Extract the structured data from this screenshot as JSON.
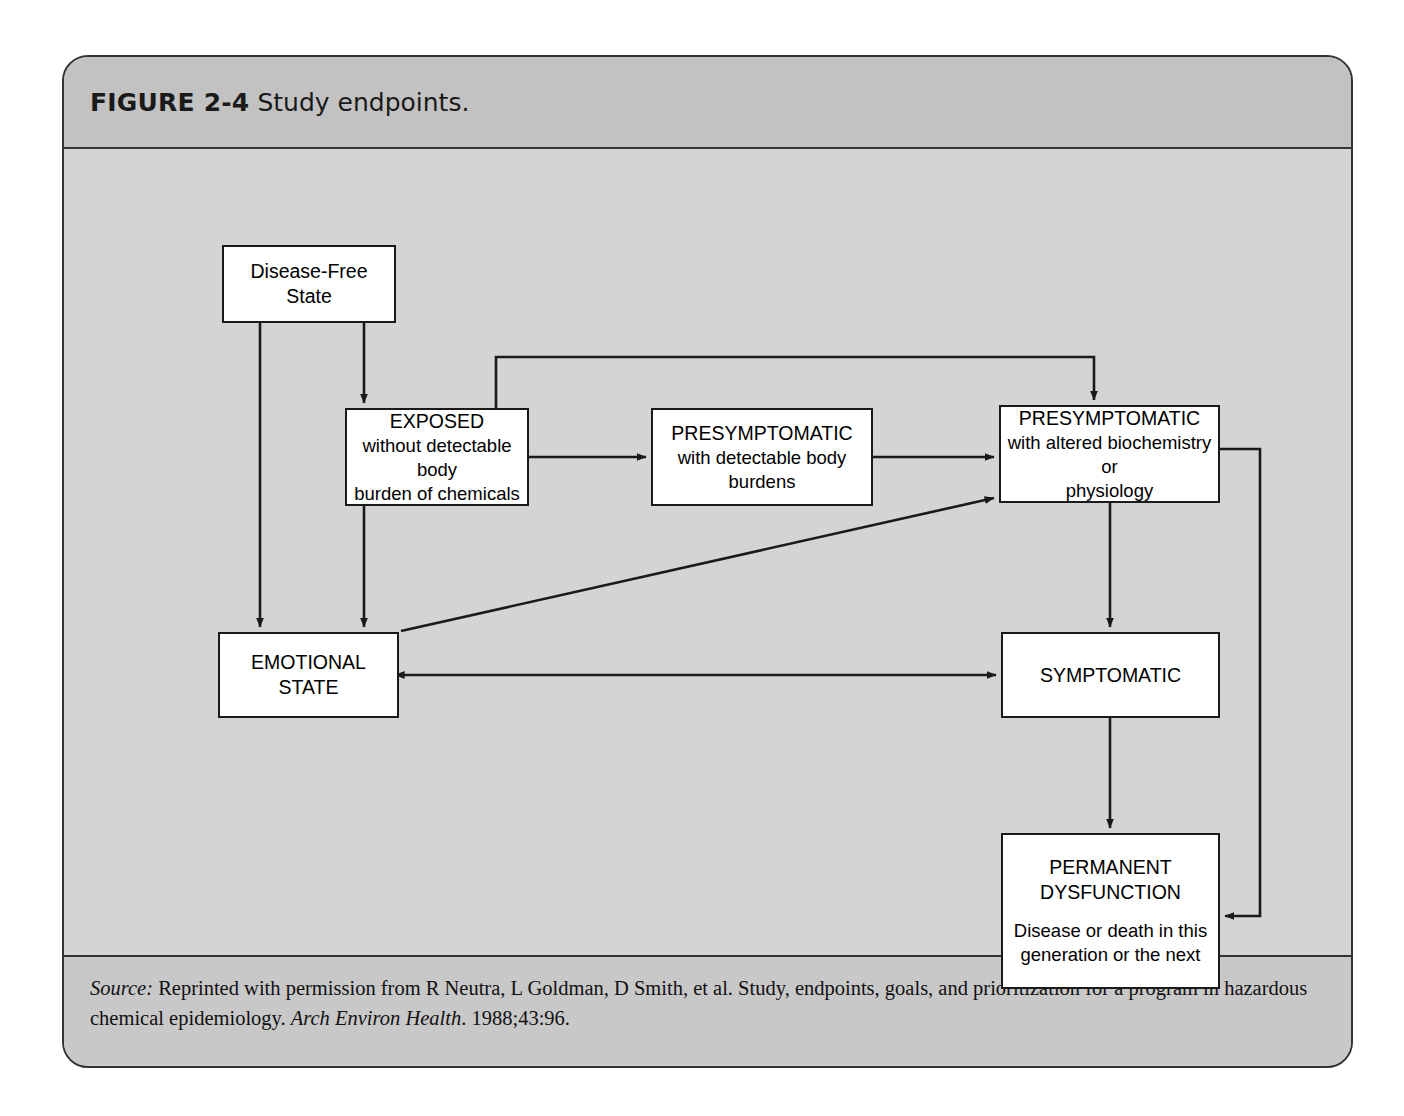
{
  "figure": {
    "number": "FIGURE 2-4",
    "caption": "Study endpoints."
  },
  "diagram": {
    "type": "flowchart",
    "nodes": [
      {
        "id": "disease-free-state",
        "title": "Disease-Free",
        "title2": "State",
        "subtitle": "",
        "subtitle2": "",
        "x": 158,
        "y": 96,
        "w": 174,
        "h": 78
      },
      {
        "id": "exposed",
        "title": "EXPOSED",
        "title2": "",
        "subtitle": "without detectable body",
        "subtitle2": "burden of chemicals",
        "x": 281,
        "y": 259,
        "w": 184,
        "h": 98
      },
      {
        "id": "presymptomatic-detectable",
        "title": "PRESYMPTOMATIC",
        "title2": "",
        "subtitle": "with detectable body burdens",
        "subtitle2": "",
        "x": 587,
        "y": 259,
        "w": 222,
        "h": 98
      },
      {
        "id": "presymptomatic-altered",
        "title": "PRESYMPTOMATIC",
        "title2": "",
        "subtitle": "with altered biochemistry or",
        "subtitle2": "physiology",
        "x": 935,
        "y": 256,
        "w": 221,
        "h": 98
      },
      {
        "id": "emotional-state",
        "title": "EMOTIONAL",
        "title2": "STATE",
        "subtitle": "",
        "subtitle2": "",
        "x": 154,
        "y": 483,
        "w": 181,
        "h": 86
      },
      {
        "id": "symptomatic",
        "title": "SYMPTOMATIC",
        "title2": "",
        "subtitle": "",
        "subtitle2": "",
        "x": 937,
        "y": 483,
        "w": 219,
        "h": 86
      },
      {
        "id": "permanent-dysfunction",
        "title": "PERMANENT",
        "title2": "DYSFUNCTION",
        "subtitle": "Disease or death in this",
        "subtitle2": "generation or the next",
        "x": 937,
        "y": 684,
        "w": 219,
        "h": 156
      }
    ],
    "edges": [
      {
        "from": "disease-free-state",
        "to": "emotional-state",
        "style": "orthogonal",
        "direction": "one-way"
      },
      {
        "from": "disease-free-state",
        "to": "exposed",
        "style": "orthogonal",
        "direction": "one-way"
      },
      {
        "from": "exposed",
        "to": "emotional-state",
        "style": "orthogonal",
        "direction": "one-way"
      },
      {
        "from": "exposed",
        "to": "presymptomatic-detectable",
        "style": "straight",
        "direction": "one-way"
      },
      {
        "from": "exposed",
        "to": "presymptomatic-altered",
        "style": "orthogonal-bypass-top",
        "direction": "one-way"
      },
      {
        "from": "presymptomatic-detectable",
        "to": "presymptomatic-altered",
        "style": "straight",
        "direction": "one-way"
      },
      {
        "from": "emotional-state",
        "to": "presymptomatic-altered",
        "style": "diagonal",
        "direction": "one-way"
      },
      {
        "from": "emotional-state",
        "to": "symptomatic",
        "style": "straight",
        "direction": "two-way"
      },
      {
        "from": "presymptomatic-altered",
        "to": "symptomatic",
        "style": "straight",
        "direction": "one-way"
      },
      {
        "from": "symptomatic",
        "to": "permanent-dysfunction",
        "style": "straight",
        "direction": "one-way"
      },
      {
        "from": "presymptomatic-altered",
        "to": "permanent-dysfunction",
        "style": "orthogonal-bypass-right",
        "direction": "one-way"
      }
    ],
    "colors": {
      "node_fill": "#ffffff",
      "node_stroke": "#1a1a1a",
      "canvas": "#d4d4d4",
      "header": "#c2c2c2",
      "frame_stroke": "#333333"
    }
  },
  "source": {
    "label": "Source:",
    "part1": " Reprinted with permission from R Neutra, L Goldman, D Smith, et al. Study, endpoints, goals, and prioritization for a program in hazardous chemical epidemiology. ",
    "journal": "Arch Environ Health",
    "part2": ". 1988;43:96."
  }
}
